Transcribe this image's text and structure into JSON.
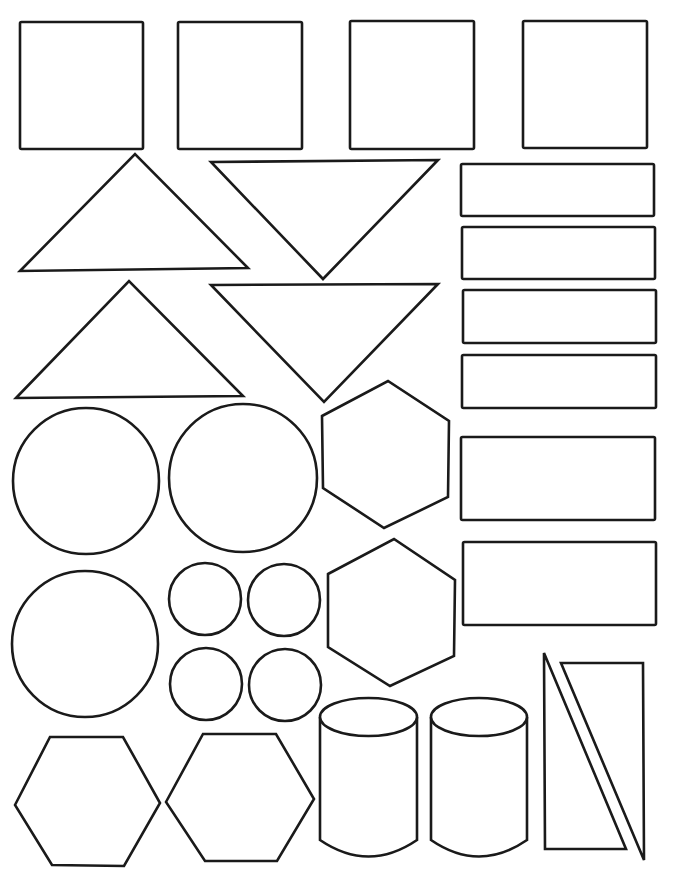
{
  "sheet": {
    "title": "Geometric shapes cut-out sheet",
    "background": "#ffffff",
    "stroke_color": "#1a1a1a",
    "width": 676,
    "height": 883
  },
  "shapes": {
    "squares": [
      {
        "x": 20,
        "y": 22,
        "w": 123,
        "h": 127
      },
      {
        "x": 178,
        "y": 22,
        "w": 124,
        "h": 127
      },
      {
        "x": 350,
        "y": 21,
        "w": 124,
        "h": 128
      },
      {
        "x": 523,
        "y": 21,
        "w": 124,
        "h": 127
      }
    ],
    "triangles": [
      {
        "points": "20,271 135,154 248,268"
      },
      {
        "points": "211,162 438,160 323,279"
      },
      {
        "points": "16,398 129,281 243,396"
      },
      {
        "points": "211,285 438,284 324,402"
      }
    ],
    "rectangles": [
      {
        "x": 461,
        "y": 164,
        "w": 193,
        "h": 52
      },
      {
        "x": 462,
        "y": 227,
        "w": 193,
        "h": 52
      },
      {
        "x": 463,
        "y": 290,
        "w": 193,
        "h": 53
      },
      {
        "x": 462,
        "y": 355,
        "w": 194,
        "h": 53
      },
      {
        "x": 461,
        "y": 437,
        "w": 194,
        "h": 83
      },
      {
        "x": 463,
        "y": 542,
        "w": 193,
        "h": 83
      }
    ],
    "circles": [
      {
        "cx": 86,
        "cy": 481,
        "r": 73
      },
      {
        "cx": 243,
        "cy": 478,
        "r": 74
      },
      {
        "cx": 85,
        "cy": 644,
        "r": 73
      },
      {
        "cx": 205,
        "cy": 599,
        "r": 36
      },
      {
        "cx": 284,
        "cy": 600,
        "r": 36
      },
      {
        "cx": 206,
        "cy": 684,
        "r": 36
      },
      {
        "cx": 285,
        "cy": 685,
        "r": 36
      }
    ],
    "hexagons": [
      {
        "points": "322,416 388,381 449,421 448,497 384,528 323,488"
      },
      {
        "points": "328,574 394,539 455,580 454,656 390,686 328,647"
      },
      {
        "points": "15,805 50,737 123,737 160,803 124,866 52,865"
      },
      {
        "points": "166,802 203,734 276,734 314,799 277,861 205,861"
      }
    ],
    "cylinders": [
      {
        "x": 320,
        "y": 698,
        "w": 97,
        "h": 150,
        "ry": 19
      },
      {
        "x": 431,
        "y": 698,
        "w": 96,
        "h": 150,
        "ry": 19
      }
    ],
    "right_triangles": [
      {
        "points": "544,653 545,849 626,849"
      },
      {
        "points": "561,663 643,663 644,860"
      }
    ]
  }
}
